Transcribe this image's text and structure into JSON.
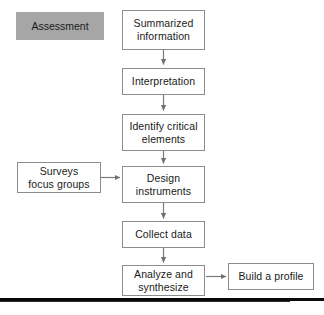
{
  "diagram": {
    "background_color": "#ffffff",
    "box_border_color": "#8c8c8c",
    "arrow_color": "#7a7a7a",
    "legend_fill_color": "#a6a6a6",
    "rule_color": "#0a0a0a"
  },
  "legend": {
    "label": "Assessment"
  },
  "nodes": [
    {
      "id": "summarized-information",
      "label": "Summarized\ninformation"
    },
    {
      "id": "interpretation",
      "label": "Interpretation"
    },
    {
      "id": "identify-critical-elements",
      "label": "Identify critical\nelements"
    },
    {
      "id": "surveys-focus-groups",
      "label": "Surveys\nfocus groups"
    },
    {
      "id": "design-instruments",
      "label": "Design\ninstruments"
    },
    {
      "id": "collect-data",
      "label": "Collect data"
    },
    {
      "id": "analyze-and-synthesize",
      "label": "Analyze and\nsynthesize"
    },
    {
      "id": "build-a-profile",
      "label": "Build a profile"
    }
  ],
  "edges": [
    {
      "from": "summarized-information",
      "to": "interpretation",
      "direction": "down"
    },
    {
      "from": "interpretation",
      "to": "identify-critical-elements",
      "direction": "down"
    },
    {
      "from": "identify-critical-elements",
      "to": "design-instruments",
      "direction": "down"
    },
    {
      "from": "surveys-focus-groups",
      "to": "design-instruments",
      "direction": "right"
    },
    {
      "from": "design-instruments",
      "to": "collect-data",
      "direction": "down"
    },
    {
      "from": "collect-data",
      "to": "analyze-and-synthesize",
      "direction": "down"
    },
    {
      "from": "analyze-and-synthesize",
      "to": "build-a-profile",
      "direction": "right"
    }
  ]
}
